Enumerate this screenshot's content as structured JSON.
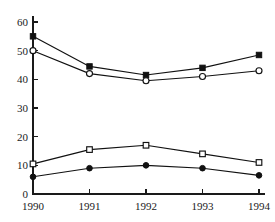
{
  "chart_data": {
    "type": "line",
    "title": "",
    "subtitle": "",
    "xlabel": "",
    "ylabel": "",
    "categories": [
      "1990",
      "1991",
      "1992",
      "1993",
      "1994"
    ],
    "x": [
      1990,
      1991,
      1992,
      1993,
      1994
    ],
    "xlim": [
      1990,
      1994
    ],
    "ylim": [
      0,
      60
    ],
    "yticks": [
      0,
      10,
      20,
      30,
      40,
      50,
      60
    ],
    "ytick_labels": [
      "0",
      "10",
      "20",
      "30",
      "40",
      "50",
      "60"
    ],
    "xtick_labels": [
      "1990",
      "1991",
      "1992",
      "1993",
      "1994"
    ],
    "grid": false,
    "legend": "none",
    "axis_style": "left-bottom-spines-only",
    "series": [
      {
        "name": "series-filled-square",
        "marker": "filled-square",
        "color": "#111111",
        "values": [
          55,
          44.5,
          41.5,
          44,
          48.5
        ]
      },
      {
        "name": "series-open-circle",
        "marker": "open-circle",
        "color": "#111111",
        "values": [
          50,
          42,
          39.5,
          41,
          43
        ]
      },
      {
        "name": "series-open-square",
        "marker": "open-square",
        "color": "#111111",
        "values": [
          10.5,
          15.5,
          17,
          14,
          11
        ]
      },
      {
        "name": "series-filled-circle",
        "marker": "filled-circle",
        "color": "#111111",
        "values": [
          6,
          9,
          10,
          9,
          6.5
        ]
      }
    ]
  }
}
